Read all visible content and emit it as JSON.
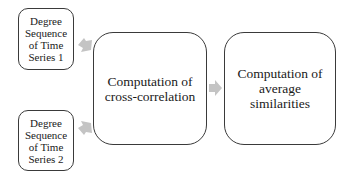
{
  "diagram": {
    "nodes": [
      {
        "id": "input1",
        "label": "Degree\nSequence\nof Time\nSeries 1"
      },
      {
        "id": "input2",
        "label": "Degree\nSequence\nof Time\nSeries 2"
      },
      {
        "id": "crosscorr",
        "label": "Computation of\ncross-correlation"
      },
      {
        "id": "avgsim",
        "label": "Computation of\naverage\nsimilarities"
      }
    ],
    "edges": [
      {
        "from": "input1",
        "to": "crosscorr"
      },
      {
        "from": "input2",
        "to": "crosscorr"
      },
      {
        "from": "crosscorr",
        "to": "avgsim"
      }
    ],
    "colors": {
      "border": "#3a3a3a",
      "arrow": "#c8c8c8",
      "background": "#ffffff"
    }
  }
}
